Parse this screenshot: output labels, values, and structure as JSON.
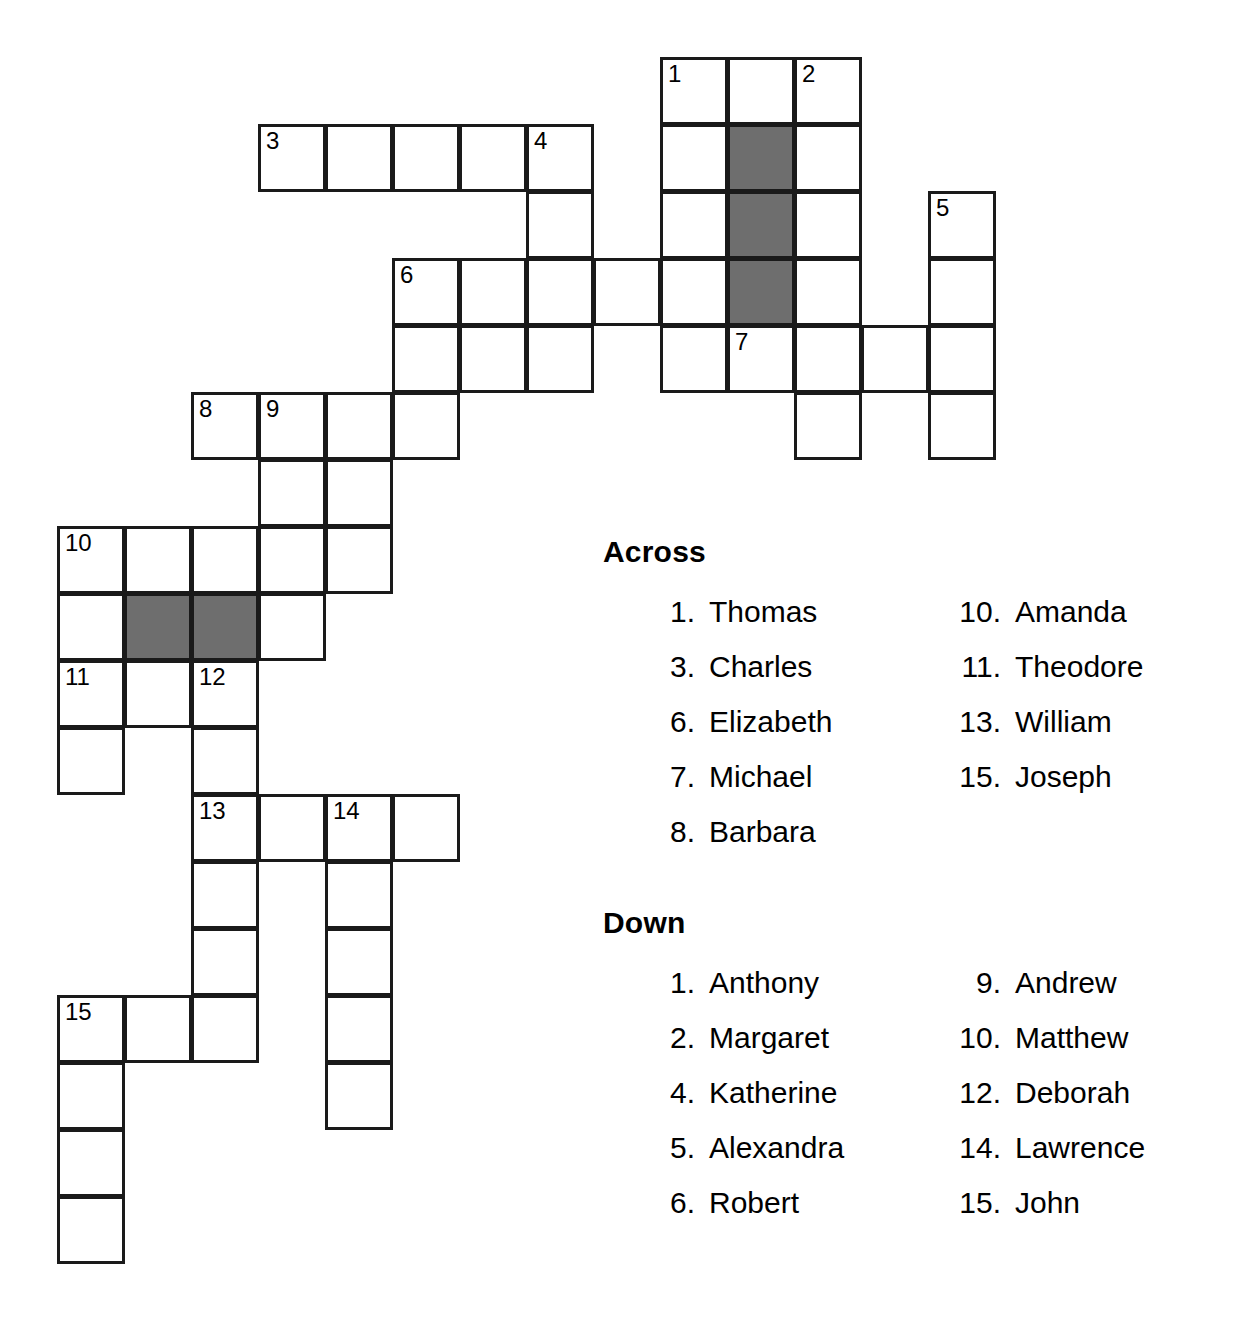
{
  "puzzle": {
    "grid": {
      "origin_x": 57,
      "origin_y": 57,
      "cell_size": 67,
      "cells": [
        {
          "r": 0,
          "c": 9,
          "n": "1"
        },
        {
          "r": 0,
          "c": 10
        },
        {
          "r": 0,
          "c": 11,
          "n": "2"
        },
        {
          "r": 1,
          "c": 3,
          "n": "3"
        },
        {
          "r": 1,
          "c": 4
        },
        {
          "r": 1,
          "c": 5
        },
        {
          "r": 1,
          "c": 6
        },
        {
          "r": 1,
          "c": 7,
          "n": "4"
        },
        {
          "r": 1,
          "c": 9
        },
        {
          "r": 1,
          "c": 10,
          "blocked": true
        },
        {
          "r": 1,
          "c": 11
        },
        {
          "r": 2,
          "c": 7
        },
        {
          "r": 2,
          "c": 9
        },
        {
          "r": 2,
          "c": 10,
          "blocked": true
        },
        {
          "r": 2,
          "c": 11
        },
        {
          "r": 2,
          "c": 13,
          "n": "5"
        },
        {
          "r": 3,
          "c": 5,
          "n": "6"
        },
        {
          "r": 3,
          "c": 6
        },
        {
          "r": 3,
          "c": 7
        },
        {
          "r": 3,
          "c": 8
        },
        {
          "r": 3,
          "c": 9
        },
        {
          "r": 3,
          "c": 10,
          "blocked": true
        },
        {
          "r": 3,
          "c": 11
        },
        {
          "r": 3,
          "c": 13
        },
        {
          "r": 4,
          "c": 5
        },
        {
          "r": 4,
          "c": 6
        },
        {
          "r": 4,
          "c": 7
        },
        {
          "r": 4,
          "c": 9
        },
        {
          "r": 4,
          "c": 10,
          "n": "7"
        },
        {
          "r": 4,
          "c": 11
        },
        {
          "r": 4,
          "c": 12
        },
        {
          "r": 4,
          "c": 13
        },
        {
          "r": 5,
          "c": 2,
          "n": "8"
        },
        {
          "r": 5,
          "c": 3,
          "n": "9"
        },
        {
          "r": 5,
          "c": 4
        },
        {
          "r": 5,
          "c": 5
        },
        {
          "r": 5,
          "c": 11
        },
        {
          "r": 5,
          "c": 13
        },
        {
          "r": 6,
          "c": 3
        },
        {
          "r": 6,
          "c": 4
        },
        {
          "r": 7,
          "c": 0,
          "n": "10"
        },
        {
          "r": 7,
          "c": 1
        },
        {
          "r": 7,
          "c": 2
        },
        {
          "r": 7,
          "c": 3
        },
        {
          "r": 7,
          "c": 4
        },
        {
          "r": 8,
          "c": 0
        },
        {
          "r": 8,
          "c": 1,
          "blocked": true
        },
        {
          "r": 8,
          "c": 2,
          "blocked": true
        },
        {
          "r": 8,
          "c": 3
        },
        {
          "r": 9,
          "c": 0,
          "n": "11"
        },
        {
          "r": 9,
          "c": 1
        },
        {
          "r": 9,
          "c": 2,
          "n": "12"
        },
        {
          "r": 10,
          "c": 0
        },
        {
          "r": 10,
          "c": 2
        },
        {
          "r": 11,
          "c": 2,
          "n": "13"
        },
        {
          "r": 11,
          "c": 3
        },
        {
          "r": 11,
          "c": 4,
          "n": "14"
        },
        {
          "r": 11,
          "c": 5
        },
        {
          "r": 12,
          "c": 2
        },
        {
          "r": 12,
          "c": 4
        },
        {
          "r": 13,
          "c": 2
        },
        {
          "r": 13,
          "c": 4
        },
        {
          "r": 14,
          "c": 0,
          "n": "15"
        },
        {
          "r": 14,
          "c": 1
        },
        {
          "r": 14,
          "c": 2
        },
        {
          "r": 14,
          "c": 4
        },
        {
          "r": 15,
          "c": 0
        },
        {
          "r": 15,
          "c": 4
        },
        {
          "r": 16,
          "c": 0
        },
        {
          "r": 17,
          "c": 0
        }
      ]
    },
    "colors": {
      "cell_border": "#1a1a1a",
      "cell_fill": "#ffffff",
      "blocked_fill": "#6e6e6e",
      "text": "#000000"
    }
  },
  "clues": {
    "across": {
      "heading": "Across",
      "left_column": [
        {
          "number": "1.",
          "answer": "Thomas"
        },
        {
          "number": "3.",
          "answer": "Charles"
        },
        {
          "number": "6.",
          "answer": "Elizabeth"
        },
        {
          "number": "7.",
          "answer": "Michael"
        },
        {
          "number": "8.",
          "answer": "Barbara"
        }
      ],
      "right_column": [
        {
          "number": "10.",
          "answer": "Amanda"
        },
        {
          "number": "11.",
          "answer": "Theodore"
        },
        {
          "number": "13.",
          "answer": "William"
        },
        {
          "number": "15.",
          "answer": "Joseph"
        }
      ]
    },
    "down": {
      "heading": "Down",
      "left_column": [
        {
          "number": "1.",
          "answer": "Anthony"
        },
        {
          "number": "2.",
          "answer": "Margaret"
        },
        {
          "number": "4.",
          "answer": "Katherine"
        },
        {
          "number": "5.",
          "answer": "Alexandra"
        },
        {
          "number": "6.",
          "answer": "Robert"
        }
      ],
      "right_column": [
        {
          "number": "9.",
          "answer": "Andrew"
        },
        {
          "number": "10.",
          "answer": "Matthew"
        },
        {
          "number": "12.",
          "answer": "Deborah"
        },
        {
          "number": "14.",
          "answer": "Lawrence"
        },
        {
          "number": "15.",
          "answer": "John"
        }
      ]
    }
  }
}
